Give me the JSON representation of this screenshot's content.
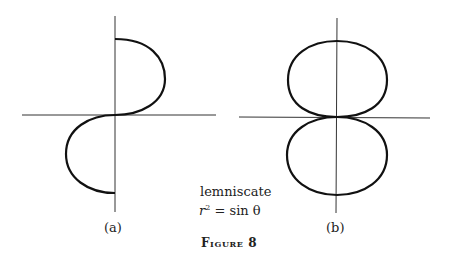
{
  "figure": {
    "caption": "Figure 8",
    "curve_name": "lemniscate",
    "equation": {
      "lhs": "r",
      "exp": "2",
      "op": "=",
      "rhs": "sin θ"
    },
    "panels": [
      {
        "label": "(a)",
        "description": "curve traced as S-shape: upper half-loop on right, lower half-loop on left"
      },
      {
        "label": "(b)",
        "description": "lemniscate: two closed loops above and below the x-axis, tangent at the origin"
      }
    ],
    "colors": {
      "curve": "#111111",
      "axis": "#333333",
      "text": "#222222"
    }
  }
}
